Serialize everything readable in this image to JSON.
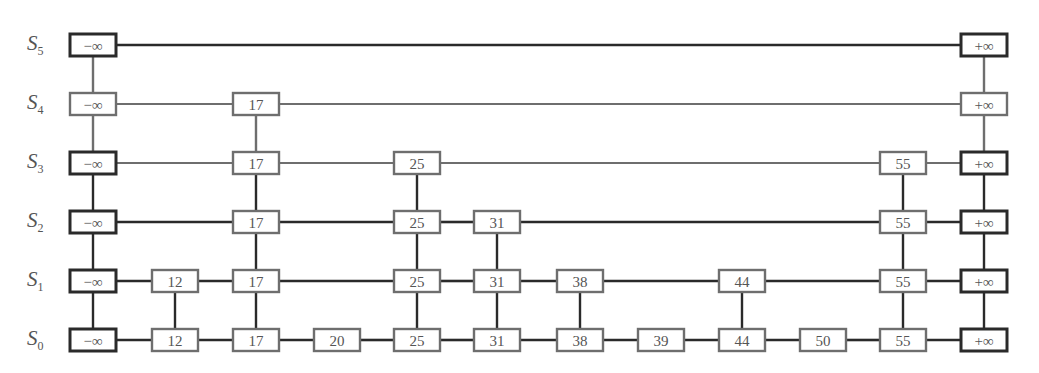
{
  "diagram": {
    "type": "skip-list",
    "levels": [
      {
        "label": "S",
        "index": "5",
        "keys": [
          "-∞",
          "+∞"
        ]
      },
      {
        "label": "S",
        "index": "4",
        "keys": [
          "-∞",
          "17",
          "+∞"
        ]
      },
      {
        "label": "S",
        "index": "3",
        "keys": [
          "-∞",
          "17",
          "25",
          "55",
          "+∞"
        ]
      },
      {
        "label": "S",
        "index": "2",
        "keys": [
          "-∞",
          "17",
          "25",
          "31",
          "55",
          "+∞"
        ]
      },
      {
        "label": "S",
        "index": "1",
        "keys": [
          "-∞",
          "12",
          "17",
          "25",
          "31",
          "38",
          "44",
          "55",
          "+∞"
        ]
      },
      {
        "label": "S",
        "index": "0",
        "keys": [
          "-∞",
          "12",
          "17",
          "20",
          "25",
          "31",
          "38",
          "39",
          "44",
          "50",
          "55",
          "+∞"
        ]
      }
    ],
    "columns": [
      "-∞",
      "12",
      "17",
      "20",
      "25",
      "31",
      "38",
      "39",
      "44",
      "50",
      "55",
      "+∞"
    ],
    "colors": {
      "dark": "#2a2a2a",
      "gray": "#6e6e6e",
      "text": "#555555"
    }
  }
}
